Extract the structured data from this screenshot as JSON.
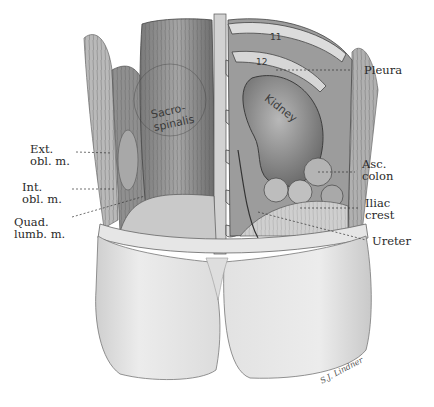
{
  "figure": {
    "type": "anatomical-illustration",
    "view": "posterior lumbar region, kidney exposure",
    "palette": {
      "background": "#ffffff",
      "skin": "#e9e9e9",
      "skin_shadow": "#c8c8c8",
      "muscle": "#8e8e8e",
      "muscle_dark": "#5e5e5e",
      "organ": "#9a9a9a",
      "bone": "#d8d8d8",
      "ink": "#2a2a2a"
    }
  },
  "labels": {
    "right": [
      {
        "id": "pleura",
        "text": "Pleura"
      },
      {
        "id": "asc-colon",
        "lines": [
          "Asc.",
          "colon"
        ]
      },
      {
        "id": "iliac-crest",
        "lines": [
          "Iliac",
          "crest"
        ]
      },
      {
        "id": "ureter",
        "text": "Ureter"
      }
    ],
    "left": [
      {
        "id": "ext-obl",
        "lines": [
          "Ext.",
          "obl. m."
        ]
      },
      {
        "id": "int-obl",
        "lines": [
          "Int.",
          "obl. m."
        ]
      },
      {
        "id": "quad-lumb",
        "lines": [
          "Quad.",
          "lumb. m."
        ]
      }
    ],
    "inline": {
      "sacrospinalis": [
        "Sacro-",
        "spinalis"
      ],
      "kidney": "Kidney",
      "rib11": "11",
      "rib12": "12"
    },
    "signature": "S.J. Lindner"
  }
}
